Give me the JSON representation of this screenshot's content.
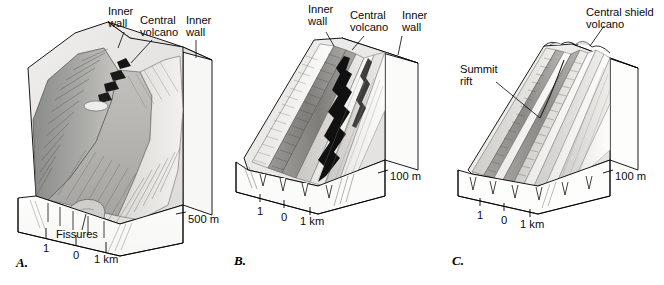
{
  "figure": {
    "background_color": "#ffffff",
    "line_color": "#000000"
  },
  "panels": [
    {
      "id": "A",
      "letter": "A.",
      "labels": [
        {
          "name": "inner-wall-left",
          "text": "Inner\nwall"
        },
        {
          "name": "central-volcano",
          "text": "Central\nvolcano"
        },
        {
          "name": "inner-wall-right",
          "text": "Inner\nwall"
        },
        {
          "name": "fissures",
          "text": "Fissures"
        }
      ],
      "vertical_scale": "500 m",
      "horizontal_scale": {
        "left": "1",
        "zero": "0",
        "right": "1 km"
      },
      "terrain": {
        "type": "rift-valley-with-central-volcano",
        "relief_label": "deep axial valley, steep inner walls"
      }
    },
    {
      "id": "B",
      "letter": "B.",
      "labels": [
        {
          "name": "inner-wall-left",
          "text": "Inner\nwall"
        },
        {
          "name": "central-volcano",
          "text": "Central\nvolcano"
        },
        {
          "name": "inner-wall-right",
          "text": "Inner\nwall"
        }
      ],
      "vertical_scale": "100 m",
      "horizontal_scale": {
        "left": "1",
        "zero": "0",
        "right": "1 km"
      },
      "terrain": {
        "type": "shallow-axial-valley",
        "relief_label": "subdued valley, linear ridges"
      }
    },
    {
      "id": "C",
      "letter": "C.",
      "labels": [
        {
          "name": "central-shield-volcano",
          "text": "Central shield\nvolcano"
        },
        {
          "name": "summit-rift",
          "text": "Summit\nrift"
        }
      ],
      "vertical_scale": "100 m",
      "horizontal_scale": {
        "left": "1",
        "zero": "0",
        "right": "1 km"
      },
      "terrain": {
        "type": "axial-high-shield",
        "relief_label": "broad axial high with summit rift"
      }
    }
  ]
}
